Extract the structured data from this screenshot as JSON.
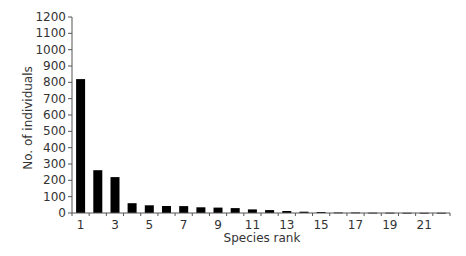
{
  "chart_data": {
    "type": "bar",
    "title": "",
    "xlabel": "Species rank",
    "ylabel": "No. of individuals",
    "ylim": [
      0,
      1200
    ],
    "yticks": [
      0,
      100,
      200,
      300,
      400,
      500,
      600,
      700,
      800,
      900,
      1000,
      1100,
      1200
    ],
    "xtick_labels": [
      "1",
      "3",
      "5",
      "7",
      "9",
      "11",
      "13",
      "15",
      "17",
      "19",
      "21"
    ],
    "categories": [
      "1",
      "2",
      "3",
      "4",
      "5",
      "6",
      "7",
      "8",
      "9",
      "10",
      "11",
      "12",
      "13",
      "14",
      "15",
      "16",
      "17",
      "18",
      "19",
      "20",
      "21",
      "22"
    ],
    "values": [
      820,
      262,
      220,
      60,
      47,
      43,
      42,
      35,
      33,
      30,
      22,
      18,
      12,
      8,
      6,
      3,
      3,
      2,
      2,
      1,
      1,
      1
    ],
    "grid": false,
    "legend": null,
    "bar_color": "#000000"
  }
}
